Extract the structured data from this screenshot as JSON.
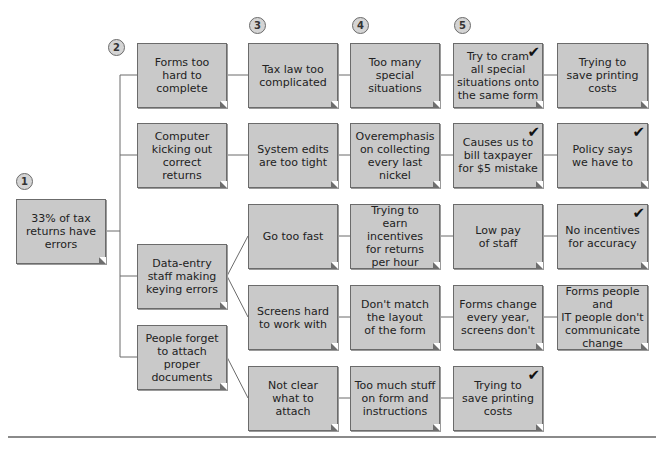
{
  "diagram": {
    "type": "why-why tree",
    "step_markers": [
      {
        "label": "1",
        "x": 16,
        "y": 173
      },
      {
        "label": "2",
        "x": 108,
        "y": 39
      },
      {
        "label": "3",
        "x": 249,
        "y": 17
      },
      {
        "label": "4",
        "x": 352,
        "y": 17
      },
      {
        "label": "5",
        "x": 454,
        "y": 17
      }
    ],
    "nodes": [
      {
        "id": "root",
        "text": "33% of tax\nreturns have\nerrors",
        "x": 16,
        "y": 199,
        "w": 90,
        "h": 65,
        "checked": false
      },
      {
        "id": "forms-hard",
        "text": "Forms too\nhard to\ncomplete",
        "x": 137,
        "y": 43,
        "w": 90,
        "h": 65,
        "checked": false
      },
      {
        "id": "computer-kicking",
        "text": "Computer\nkicking out\ncorrect\nreturns",
        "x": 137,
        "y": 123,
        "w": 90,
        "h": 65,
        "checked": false
      },
      {
        "id": "data-entry",
        "text": "Data-entry\nstaff making\nkeying errors",
        "x": 137,
        "y": 244,
        "w": 90,
        "h": 65,
        "checked": false
      },
      {
        "id": "people-forget",
        "text": "People forget\nto attach\nproper\ndocuments",
        "x": 137,
        "y": 325,
        "w": 90,
        "h": 65,
        "checked": false
      },
      {
        "id": "tax-law",
        "text": "Tax law too\ncomplicated",
        "x": 248,
        "y": 43,
        "w": 90,
        "h": 65,
        "checked": false
      },
      {
        "id": "system-edits",
        "text": "System edits\nare too tight",
        "x": 248,
        "y": 123,
        "w": 90,
        "h": 65,
        "checked": false
      },
      {
        "id": "go-fast",
        "text": "Go too fast",
        "x": 248,
        "y": 204,
        "w": 90,
        "h": 65,
        "checked": false
      },
      {
        "id": "screens-hard",
        "text": "Screens hard\nto work with",
        "x": 248,
        "y": 285,
        "w": 90,
        "h": 65,
        "checked": false
      },
      {
        "id": "not-clear",
        "text": "Not clear\nwhat to\nattach",
        "x": 248,
        "y": 366,
        "w": 90,
        "h": 65,
        "checked": false
      },
      {
        "id": "special-situations",
        "text": "Too many\nspecial\nsituations",
        "x": 350,
        "y": 43,
        "w": 90,
        "h": 65,
        "checked": false
      },
      {
        "id": "overemphasis",
        "text": "Overemphasis\non collecting\nevery last nickel",
        "x": 350,
        "y": 123,
        "w": 90,
        "h": 65,
        "checked": false
      },
      {
        "id": "earn-incentives",
        "text": "Trying to\nearn incentives\nfor returns\nper hour",
        "x": 350,
        "y": 204,
        "w": 90,
        "h": 65,
        "checked": false
      },
      {
        "id": "dont-match",
        "text": "Don't match\nthe layout\nof the form",
        "x": 350,
        "y": 285,
        "w": 90,
        "h": 65,
        "checked": false
      },
      {
        "id": "too-much-stuff",
        "text": "Too much stuff\non form and\ninstructions",
        "x": 350,
        "y": 366,
        "w": 90,
        "h": 65,
        "checked": false
      },
      {
        "id": "cram",
        "text": "Try to cram\nall special\nsituations onto\nthe same form",
        "x": 453,
        "y": 43,
        "w": 90,
        "h": 65,
        "checked": true
      },
      {
        "id": "bill-taxpayer",
        "text": "Causes us to\nbill taxpayer\nfor $5 mistake",
        "x": 453,
        "y": 123,
        "w": 90,
        "h": 65,
        "checked": true
      },
      {
        "id": "low-pay",
        "text": "Low pay\nof staff",
        "x": 453,
        "y": 204,
        "w": 90,
        "h": 65,
        "checked": false
      },
      {
        "id": "forms-change",
        "text": "Forms change\nevery year,\nscreens don't",
        "x": 453,
        "y": 285,
        "w": 90,
        "h": 65,
        "checked": false
      },
      {
        "id": "save-printing-2",
        "text": "Trying to\nsave printing\ncosts",
        "x": 453,
        "y": 366,
        "w": 90,
        "h": 65,
        "checked": true
      },
      {
        "id": "save-printing-1",
        "text": "Trying to\nsave printing\ncosts",
        "x": 557,
        "y": 43,
        "w": 91,
        "h": 65,
        "checked": false
      },
      {
        "id": "policy",
        "text": "Policy says\nwe have to",
        "x": 557,
        "y": 123,
        "w": 91,
        "h": 65,
        "checked": true
      },
      {
        "id": "no-incentives",
        "text": "No incentives\nfor accuracy",
        "x": 557,
        "y": 204,
        "w": 91,
        "h": 65,
        "checked": true
      },
      {
        "id": "no-communicate",
        "text": "Forms people and\nIT people don't\ncommunicate\nchange",
        "x": 557,
        "y": 285,
        "w": 91,
        "h": 65,
        "checked": false
      }
    ],
    "edges": [
      [
        "root",
        "forms-hard"
      ],
      [
        "root",
        "computer-kicking"
      ],
      [
        "root",
        "data-entry"
      ],
      [
        "root",
        "people-forget"
      ],
      [
        "forms-hard",
        "tax-law"
      ],
      [
        "tax-law",
        "special-situations"
      ],
      [
        "special-situations",
        "cram"
      ],
      [
        "cram",
        "save-printing-1"
      ],
      [
        "computer-kicking",
        "system-edits"
      ],
      [
        "system-edits",
        "overemphasis"
      ],
      [
        "overemphasis",
        "bill-taxpayer"
      ],
      [
        "bill-taxpayer",
        "policy"
      ],
      [
        "data-entry",
        "go-fast"
      ],
      [
        "go-fast",
        "earn-incentives"
      ],
      [
        "earn-incentives",
        "low-pay"
      ],
      [
        "low-pay",
        "no-incentives"
      ],
      [
        "data-entry",
        "screens-hard"
      ],
      [
        "screens-hard",
        "dont-match"
      ],
      [
        "dont-match",
        "forms-change"
      ],
      [
        "forms-change",
        "no-communicate"
      ],
      [
        "people-forget",
        "not-clear"
      ],
      [
        "not-clear",
        "too-much-stuff"
      ],
      [
        "too-much-stuff",
        "save-printing-2"
      ]
    ],
    "checkmark_glyph": "✔",
    "colors": {
      "box_fill": "#c9c9c9",
      "box_border": "#6b6b6b",
      "line": "#6b6b6b",
      "circle_fill": "#d4d4d4"
    }
  }
}
